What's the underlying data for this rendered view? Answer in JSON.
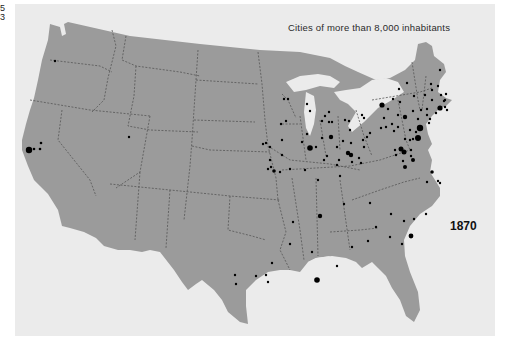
{
  "page_marks": [
    "5",
    "3"
  ],
  "map": {
    "title": "Cities of more than 8,000 inhabitants",
    "year": "1870",
    "colors": {
      "background": "#ebebeb",
      "land": "#9b9b9b",
      "borders": "#555555",
      "cities": "#000000"
    }
  }
}
